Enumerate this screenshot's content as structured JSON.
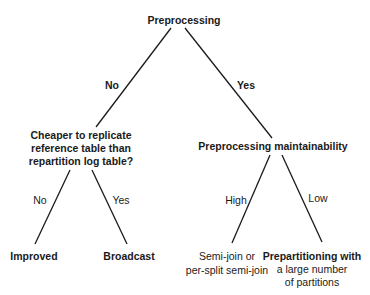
{
  "root": {
    "label": "Preprocessing"
  },
  "edges": {
    "root_no": "No",
    "root_yes": "Yes",
    "cheaper_no": "No",
    "cheaper_yes": "Yes",
    "maint_high": "High",
    "maint_low": "Low"
  },
  "nodes": {
    "cheaper": [
      "Cheaper to replicate",
      "reference table than",
      "repartition log table?"
    ],
    "maintainability": "Preprocessing maintainability"
  },
  "leaves": {
    "improved": "Improved",
    "broadcast": "Broadcast",
    "semijoin": [
      "Semi-join or",
      "per-split semi-join"
    ],
    "prepartitioning": [
      "Prepartitioning with",
      "a large number",
      "of partitions"
    ]
  },
  "colors": {
    "line": "#1a1a1a",
    "text": "#1a1a1a",
    "background": "#ffffff"
  }
}
